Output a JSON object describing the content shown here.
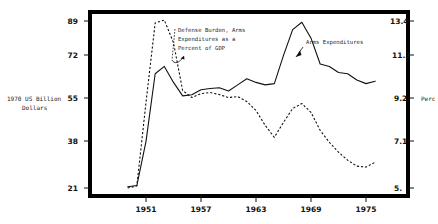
{
  "chart_data": {
    "type": "line",
    "title": "",
    "xlabel": "",
    "ylabel": "1970 US Billion Dollars",
    "y2label": "Perc",
    "x": [
      1949,
      1950,
      1951,
      1952,
      1953,
      1954,
      1955,
      1956,
      1957,
      1958,
      1959,
      1960,
      1961,
      1962,
      1963,
      1964,
      1965,
      1966,
      1967,
      1968,
      1969,
      1970,
      1971,
      1972,
      1973,
      1974,
      1975,
      1976,
      1977
    ],
    "xticks": [
      "1951",
      "1957",
      "1963",
      "1969",
      "1975"
    ],
    "xtick_values": [
      1951,
      1957,
      1963,
      1969,
      1975
    ],
    "ylim": [
      21,
      89
    ],
    "yticks": [
      "89",
      "72",
      "55",
      "38",
      "21"
    ],
    "ytick_values": [
      89,
      72,
      55,
      38,
      21
    ],
    "y2lim": [
      5,
      13.4
    ],
    "y2ticks": [
      "13.4",
      "11.3",
      "9.2",
      "7.1",
      "5."
    ],
    "y2tick_values": [
      13.4,
      11.3,
      9.2,
      7.1,
      5.0
    ],
    "grid": false,
    "legend": "annotations",
    "series": [
      {
        "name": "Arms Expenditures",
        "style": "solid",
        "axis": "left",
        "values": [
          21.5,
          22.0,
          40.0,
          67.5,
          70.5,
          64.0,
          58.5,
          59.0,
          61.0,
          61.5,
          61.8,
          60.5,
          63.0,
          65.5,
          64.0,
          63.0,
          63.5,
          75.0,
          85.5,
          88.5,
          82.0,
          71.5,
          70.5,
          68.0,
          67.5,
          65.0,
          63.5,
          64.5,
          null
        ]
      },
      {
        "name": "Defense Burden, Arms Expenditures as a Percent of GDP",
        "style": "dashed",
        "axis": "right",
        "values": [
          5.0,
          5.1,
          9.3,
          13.3,
          13.45,
          12.3,
          9.9,
          9.55,
          9.75,
          9.8,
          9.7,
          9.55,
          9.6,
          9.35,
          8.9,
          8.15,
          7.55,
          8.3,
          9.0,
          9.25,
          8.8,
          7.9,
          7.3,
          6.8,
          6.4,
          6.1,
          6.05,
          6.3,
          null
        ]
      }
    ],
    "annotations": [
      {
        "name": "defense-burden-annotation",
        "lines": [
          "Defense Burden, Arms",
          "Expenditures as a",
          "Percent of GDP"
        ],
        "points_to_series": "Defense Burden, Arms Expenditures as a Percent of GDP"
      },
      {
        "name": "arms-expenditures-annotation",
        "lines": [
          "Arms Expenditures"
        ],
        "points_to_series": "Arms Expenditures"
      }
    ]
  },
  "axes": {
    "left_title_line1": "1970 US Billion",
    "left_title_line2": "Dollars",
    "right_title": "Perc",
    "left_ticks": [
      "89",
      "72",
      "55",
      "38",
      "21"
    ],
    "right_ticks": [
      "13.4",
      "11.3",
      "9.2",
      "7.1",
      "5."
    ],
    "x_ticks": [
      "1951",
      "1957",
      "1963",
      "1969",
      "1975"
    ]
  },
  "annotations": {
    "defense_burden": {
      "l1": "Defense Burden, Arms",
      "l2": "Expenditures as a",
      "l3": "Percent of GDP"
    },
    "arms_expenditures": {
      "l1": "Arms Expenditures"
    }
  },
  "colors": {
    "line": "#111111",
    "frame": "#000000",
    "background": "#ffffff"
  }
}
